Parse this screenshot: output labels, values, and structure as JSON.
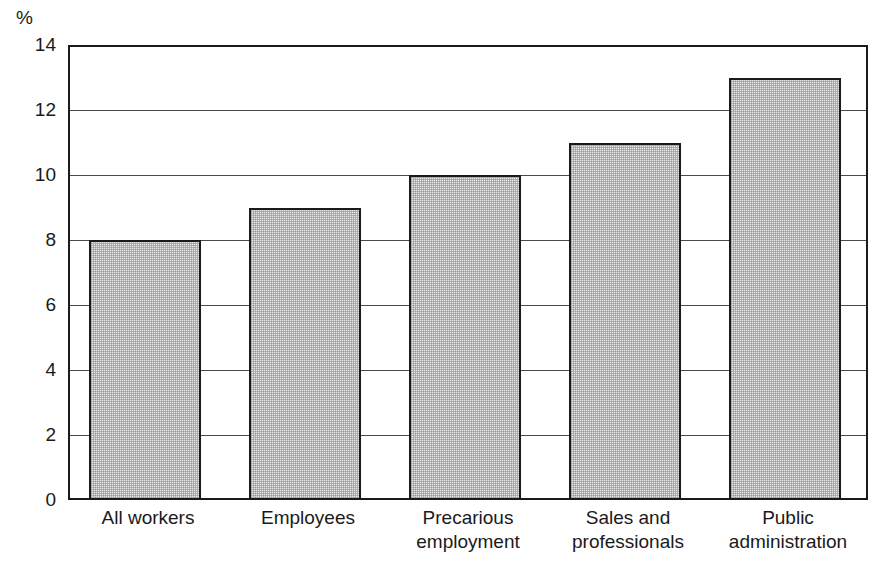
{
  "figure": {
    "cropped_title_sliver": "",
    "unit_label": "%"
  },
  "chart_data": {
    "type": "bar",
    "title": "",
    "xlabel": "",
    "ylabel": "%",
    "ylim": [
      0,
      14
    ],
    "yticks": [
      0,
      2,
      4,
      6,
      8,
      10,
      12,
      14
    ],
    "ytick_labels": [
      "0",
      "2",
      "4",
      "6",
      "8",
      "10",
      "12",
      "14"
    ],
    "grid": true,
    "grid_axis": "y",
    "legend": false,
    "categories": [
      "All workers",
      "Precarious employment",
      "Employees",
      "Sales and professionals",
      "Public administration"
    ],
    "category_lines": [
      [
        "All workers",
        ""
      ],
      [
        "Employees",
        ""
      ],
      [
        "Precarious",
        "employment"
      ],
      [
        "Sales and",
        "professionals"
      ],
      [
        "Public",
        "administration"
      ]
    ],
    "values": [
      8,
      9,
      10,
      11,
      13
    ],
    "bar_face_color": "#e6e6e6",
    "bar_edge_color": "#1a1a1a",
    "frame_color": "#1a1a1a",
    "grid_color": "#4a4a4a",
    "background_color": "#ffffff"
  }
}
